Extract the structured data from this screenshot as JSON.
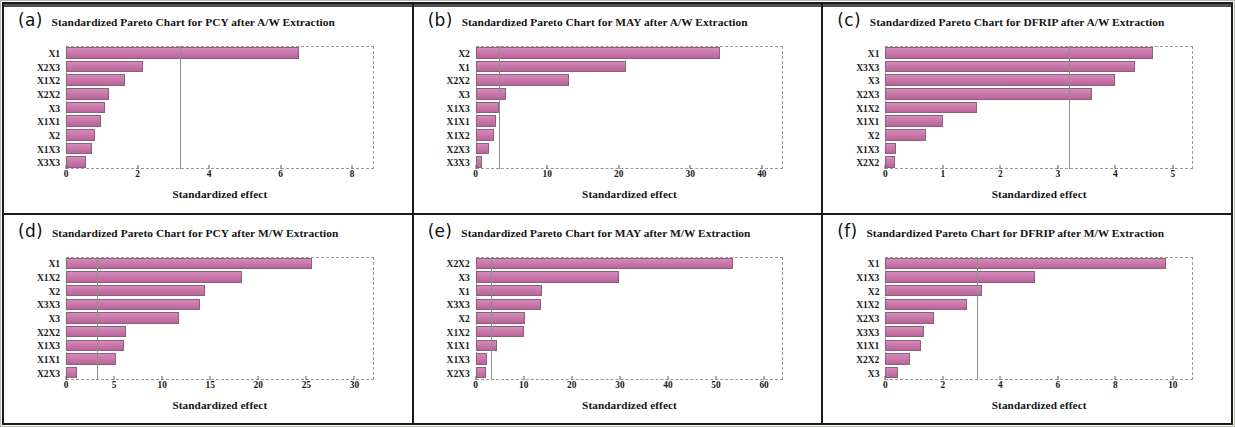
{
  "figure": {
    "label": "six-panel standardized pareto charts",
    "bar_color": "#c76aa4",
    "bar_edge_color": "#8d5f7d",
    "refline_color": "#8f8f8a"
  },
  "panels": [
    {
      "tag": "(a)",
      "title": "Standardized Pareto Chart for PCY after A/W Extraction",
      "chart_data": {
        "type": "bar",
        "orientation": "horizontal",
        "title": "Standardized Pareto Chart for PCY after A/W Extraction",
        "xlabel": "Standardized effect",
        "ylabel": "",
        "xlim": [
          0,
          8.6
        ],
        "xticks": [
          0,
          2,
          4,
          6,
          8
        ],
        "grid": false,
        "reference_line": 3.2,
        "categories": [
          "X1",
          "X2X3",
          "X1X2",
          "X2X2",
          "X3",
          "X1X1",
          "X2",
          "X1X3",
          "X3X3"
        ],
        "values": [
          6.5,
          2.15,
          1.65,
          1.2,
          1.1,
          0.98,
          0.82,
          0.72,
          0.55
        ]
      }
    },
    {
      "tag": "(b)",
      "title": "Standardized Pareto Chart for MAY after A/W Extraction",
      "chart_data": {
        "type": "bar",
        "orientation": "horizontal",
        "title": "Standardized Pareto Chart for MAY after A/W Extraction",
        "xlabel": "Standardized effect",
        "ylabel": "",
        "xlim": [
          0,
          43
        ],
        "xticks": [
          0,
          10,
          20,
          30,
          40
        ],
        "grid": false,
        "reference_line": 3.2,
        "categories": [
          "X2",
          "X1",
          "X2X2",
          "X3",
          "X1X3",
          "X1X1",
          "X1X2",
          "X2X3",
          "X3X3"
        ],
        "values": [
          34.2,
          21.0,
          13.1,
          4.2,
          3.2,
          2.8,
          2.6,
          1.8,
          0.9
        ]
      }
    },
    {
      "tag": "(c)",
      "title": "Standardized Pareto Chart for DFRIP after A/W Extraction",
      "chart_data": {
        "type": "bar",
        "orientation": "horizontal",
        "title": "Standardized Pareto Chart for DFRIP after A/W Extraction",
        "xlabel": "Standardized effect",
        "ylabel": "",
        "xlim": [
          0,
          5.35
        ],
        "xticks": [
          0,
          1,
          2,
          3,
          4,
          5
        ],
        "grid": false,
        "reference_line": 3.2,
        "categories": [
          "X1",
          "X3X3",
          "X3",
          "X2X3",
          "X1X2",
          "X1X1",
          "X2",
          "X1X3",
          "X2X2"
        ],
        "values": [
          4.65,
          4.35,
          4.0,
          3.6,
          1.6,
          1.0,
          0.7,
          0.18,
          0.17
        ]
      }
    },
    {
      "tag": "(d)",
      "title": "Standardized Pareto Chart for PCY after M/W Extraction",
      "chart_data": {
        "type": "bar",
        "orientation": "horizontal",
        "title": "Standardized Pareto Chart for PCY after M/W Extraction",
        "xlabel": "Standardized effect",
        "ylabel": "",
        "xlim": [
          0,
          32
        ],
        "xticks": [
          0,
          5,
          10,
          15,
          20,
          25,
          30
        ],
        "grid": false,
        "reference_line": 3.2,
        "categories": [
          "X1",
          "X1X2",
          "X2",
          "X3X3",
          "X3",
          "X2X2",
          "X1X3",
          "X1X1",
          "X2X3"
        ],
        "values": [
          25.6,
          18.3,
          14.5,
          13.9,
          11.8,
          6.2,
          6.0,
          5.2,
          1.1
        ]
      }
    },
    {
      "tag": "(e)",
      "title": "Standardized Pareto Chart for MAY after M/W Extraction",
      "chart_data": {
        "type": "bar",
        "orientation": "horizontal",
        "title": "Standardized Pareto Chart for MAY after M/W Extraction",
        "xlabel": "Standardized effect",
        "ylabel": "",
        "xlim": [
          0,
          64
        ],
        "xticks": [
          0,
          10,
          20,
          30,
          40,
          50,
          60
        ],
        "grid": false,
        "reference_line": 3.2,
        "categories": [
          "X2X2",
          "X3",
          "X1",
          "X3X3",
          "X2",
          "X1X2",
          "X1X1",
          "X1X3",
          "X2X3"
        ],
        "values": [
          53.5,
          29.8,
          13.9,
          13.6,
          10.2,
          10.0,
          4.4,
          2.4,
          2.2
        ]
      }
    },
    {
      "tag": "(f)",
      "title": "Standardized Pareto Chart for DFRIP after M/W Extraction",
      "chart_data": {
        "type": "bar",
        "orientation": "horizontal",
        "title": "Standardized Pareto Chart for DFRIP after M/W Extraction",
        "xlabel": "Standardized effect",
        "ylabel": "",
        "xlim": [
          0,
          10.7
        ],
        "xticks": [
          0,
          2,
          4,
          6,
          8,
          10
        ],
        "grid": false,
        "reference_line": 3.2,
        "categories": [
          "X1",
          "X1X3",
          "X2",
          "X1X2",
          "X2X3",
          "X3X3",
          "X1X1",
          "X2X2",
          "X3"
        ],
        "values": [
          9.75,
          5.2,
          3.35,
          2.85,
          1.7,
          1.35,
          1.25,
          0.85,
          0.45
        ]
      }
    }
  ]
}
